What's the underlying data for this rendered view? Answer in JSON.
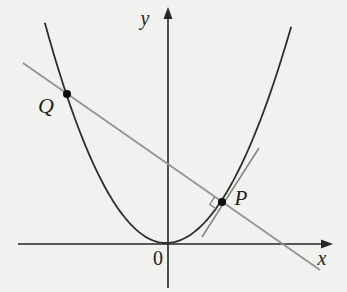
{
  "figure": {
    "labels": {
      "y_axis": "y",
      "x_axis": "x",
      "origin": "0",
      "q": "Q",
      "p": "P"
    },
    "colors": {
      "background": "#f1f1ef",
      "curve": "#2e2e2c",
      "axis": "#262624",
      "secant": "#93938f",
      "tangent": "#82827e",
      "marker": "#6f6f6b",
      "point": "#0d0d0d"
    },
    "geometry": {
      "canvas": {
        "width": 347,
        "height": 292
      },
      "x_axis": {
        "x1": 18,
        "y1": 244,
        "x2": 323,
        "y2": 244,
        "arrow": [
          [
            333,
            244
          ],
          [
            321,
            239.5
          ],
          [
            321,
            248.5
          ]
        ]
      },
      "y_axis": {
        "x1": 168,
        "y1": 288,
        "x2": 168,
        "y2": 17,
        "arrow": [
          [
            168,
            7
          ],
          [
            163.5,
            19
          ],
          [
            172.5,
            19
          ]
        ]
      },
      "parabola": {
        "vertex": [
          166,
          243
        ],
        "a_left": 0.015,
        "a_right": 0.0138,
        "x_min": 45,
        "x_max": 292
      },
      "secant": {
        "x1": 23,
        "y1": 63,
        "x2": 320,
        "y2": 270
      },
      "tangent": {
        "x1": 202,
        "y1": 237,
        "x2": 259,
        "y2": 148
      },
      "point_q": {
        "cx": 67,
        "cy": 94,
        "r": 4
      },
      "point_p": {
        "cx": 222,
        "cy": 202,
        "r": 4
      },
      "right_angle_marker": {
        "points": [
          [
            214.6,
            196.9
          ],
          [
            209.8,
            204.5
          ],
          [
            217.2,
            209.6
          ]
        ]
      },
      "label_positions": {
        "y_axis": [
          145,
          25
        ],
        "x_axis": [
          322,
          265
        ],
        "origin": [
          158,
          265
        ],
        "q": [
          46,
          113
        ],
        "p": [
          241,
          205
        ]
      }
    }
  }
}
